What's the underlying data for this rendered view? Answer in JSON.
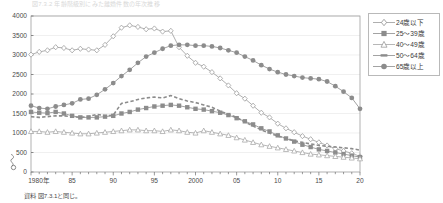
{
  "chart_title": "図7.3.2 年齢階級別にみた離婚件数の年次推移",
  "source_note": "資料 図7.3.1と同じ。",
  "legend": {
    "position": "right-top",
    "items": [
      {
        "label": "24歳以下",
        "marker": "open-diamond",
        "color": "#9a9a9a",
        "line": "solid"
      },
      {
        "label": "25〜39歳",
        "marker": "filled-square",
        "color": "#8c8c8c",
        "line": "solid"
      },
      {
        "label": "40〜49歳",
        "marker": "open-triangle",
        "color": "#a5a5a5",
        "line": "solid"
      },
      {
        "label": "50〜64歳",
        "marker": "none",
        "color": "#8c8c8c",
        "line": "dashed"
      },
      {
        "label": "65歳以上",
        "marker": "filled-circle",
        "color": "#8c8c8c",
        "line": "solid"
      }
    ]
  },
  "axes": {
    "y_ticks": [
      "0",
      "500",
      "1000",
      "1500",
      "2000",
      "2500",
      "3000",
      "3500",
      "4000"
    ],
    "x_ticks": [
      "1980年",
      "85",
      "90",
      "95",
      "2000",
      "05",
      "10",
      "15",
      "20"
    ],
    "y_axis_break": true,
    "grid": "horizontal"
  },
  "chart_data": {
    "type": "line",
    "title": "図7.3.2 年齢階級別にみた離婚件数の年次推移",
    "xlabel": "",
    "ylabel": "",
    "ylim": [
      0,
      4000
    ],
    "xlim": [
      1980,
      2020
    ],
    "grid": true,
    "legend_position": "right-top",
    "x": [
      1980,
      1981,
      1982,
      1983,
      1984,
      1985,
      1986,
      1987,
      1988,
      1989,
      1990,
      1991,
      1992,
      1993,
      1994,
      1995,
      1996,
      1997,
      1998,
      1999,
      2000,
      2001,
      2002,
      2003,
      2004,
      2005,
      2006,
      2007,
      2008,
      2009,
      2010,
      2011,
      2012,
      2013,
      2014,
      2015,
      2016,
      2017,
      2018,
      2019,
      2020
    ],
    "series": [
      {
        "name": "24歳以下",
        "marker": "open-diamond",
        "line": "solid",
        "values": [
          3010,
          3080,
          3120,
          3200,
          3180,
          3120,
          3160,
          3140,
          3120,
          3260,
          3480,
          3700,
          3760,
          3720,
          3660,
          3680,
          3600,
          3620,
          3200,
          2980,
          2800,
          2700,
          2560,
          2400,
          2220,
          2020,
          1880,
          1700,
          1520,
          1400,
          1240,
          1120,
          1020,
          920,
          840,
          760,
          680,
          600,
          540,
          480,
          400
        ]
      },
      {
        "name": "25〜39歳",
        "marker": "filled-square",
        "line": "solid",
        "values": [
          1540,
          1520,
          1510,
          1540,
          1500,
          1440,
          1400,
          1400,
          1400,
          1420,
          1440,
          1500,
          1540,
          1600,
          1640,
          1680,
          1700,
          1720,
          1700,
          1660,
          1620,
          1600,
          1560,
          1520,
          1460,
          1380,
          1300,
          1220,
          1120,
          1040,
          940,
          860,
          780,
          700,
          640,
          580,
          540,
          500,
          460,
          420,
          380
        ]
      },
      {
        "name": "40〜49歳",
        "marker": "open-triangle",
        "line": "solid",
        "values": [
          1040,
          1040,
          1020,
          1040,
          1020,
          1000,
          980,
          980,
          1000,
          1020,
          1040,
          1060,
          1080,
          1080,
          1060,
          1060,
          1040,
          1080,
          1060,
          1020,
          1000,
          1060,
          1020,
          980,
          940,
          880,
          820,
          760,
          700,
          660,
          620,
          580,
          540,
          500,
          460,
          440,
          420,
          400,
          380,
          360,
          340
        ]
      },
      {
        "name": "50〜64歳",
        "marker": "none",
        "line": "dashed",
        "values": [
          1420,
          1400,
          1420,
          1440,
          1440,
          1420,
          1400,
          1420,
          1480,
          1440,
          1460,
          1760,
          1800,
          1860,
          1900,
          1920,
          1900,
          1960,
          1880,
          1820,
          1780,
          1720,
          1660,
          1560,
          1480,
          1400,
          1280,
          1180,
          1080,
          1000,
          920,
          860,
          800,
          760,
          720,
          680,
          660,
          640,
          620,
          600,
          560
        ]
      },
      {
        "name": "65歳以上",
        "marker": "filled-circle",
        "line": "solid",
        "values": [
          1700,
          1640,
          1620,
          1680,
          1720,
          1760,
          1860,
          1880,
          1980,
          2120,
          2280,
          2460,
          2620,
          2800,
          2960,
          3060,
          3160,
          3240,
          3260,
          3260,
          3240,
          3240,
          3220,
          3180,
          3120,
          3060,
          2960,
          2860,
          2740,
          2640,
          2560,
          2500,
          2460,
          2420,
          2400,
          2380,
          2320,
          2200,
          2060,
          1900,
          1620
        ]
      }
    ]
  }
}
